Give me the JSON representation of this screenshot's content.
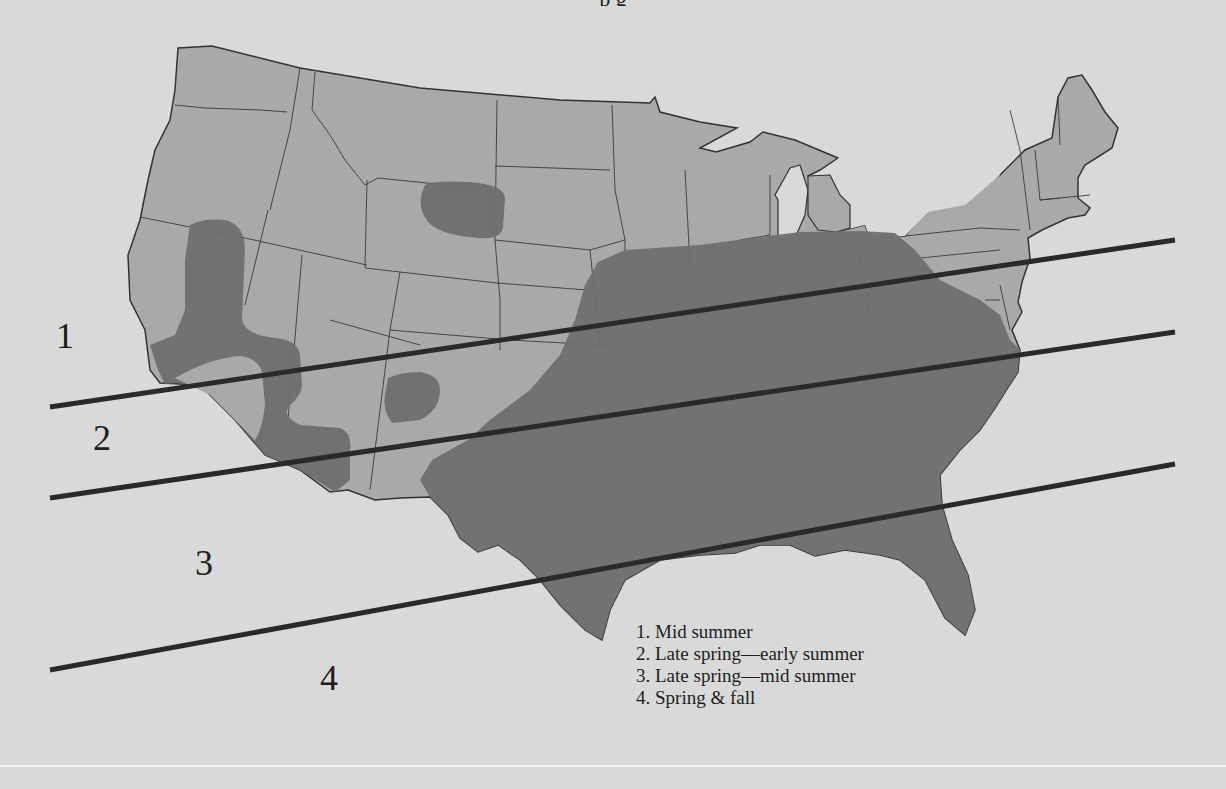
{
  "figure": {
    "top_caption_fragment": "p              g",
    "colors": {
      "background": "#d9d9d9",
      "land": "#a9a9a9",
      "zone_dark": "#6f6f6f",
      "boundary_line": "#333333",
      "divider": "#2a2a2a"
    }
  },
  "zones": {
    "labels": [
      {
        "id": "1",
        "text": "1"
      },
      {
        "id": "2",
        "text": "2"
      },
      {
        "id": "3",
        "text": "3"
      },
      {
        "id": "4",
        "text": "4"
      }
    ]
  },
  "legend": {
    "items": [
      {
        "label": "1. Mid summer"
      },
      {
        "label": "2. Late spring—early summer"
      },
      {
        "label": "3. Late spring—mid summer"
      },
      {
        "label": "4. Spring & fall"
      }
    ]
  },
  "map": {
    "subject": "Contiguous United States",
    "divider_lines": [
      {
        "x1": 50,
        "y1": 407,
        "x2": 1175,
        "y2": 240
      },
      {
        "x1": 50,
        "y1": 498,
        "x2": 1175,
        "y2": 332
      },
      {
        "x1": 50,
        "y1": 670,
        "x2": 1175,
        "y2": 464
      }
    ]
  }
}
